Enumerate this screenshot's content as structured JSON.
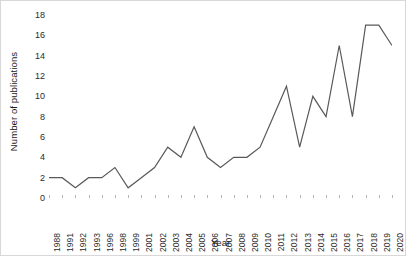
{
  "chart_data": {
    "type": "line",
    "title": "",
    "xlabel": "Year",
    "ylabel": "Number of publications",
    "categories": [
      "1988",
      "1991",
      "1992",
      "1993",
      "1996",
      "1998",
      "1999",
      "2001",
      "2002",
      "2003",
      "2004",
      "2005",
      "2006",
      "2007",
      "2008",
      "2009",
      "2010",
      "2011",
      "2012",
      "2013",
      "2014",
      "2015",
      "2016",
      "2017",
      "2018",
      "2019",
      "2020"
    ],
    "values": [
      2,
      2,
      1,
      2,
      2,
      3,
      1,
      2,
      3,
      5,
      4,
      7,
      4,
      3,
      4,
      4,
      5,
      8,
      11,
      5,
      10,
      8,
      15,
      8,
      17,
      17,
      15
    ],
    "yticks": [
      "0",
      "2",
      "4",
      "6",
      "8",
      "10",
      "12",
      "14",
      "16",
      "18"
    ],
    "ylim": [
      0,
      18
    ],
    "grid": false,
    "legend": "none",
    "line_color": "#595959",
    "background_color": "#ffffff"
  }
}
